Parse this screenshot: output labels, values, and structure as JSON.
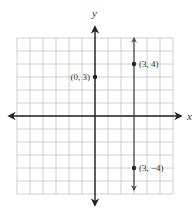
{
  "chart_data": {
    "type": "scatter",
    "title": "",
    "xlabel": "x",
    "ylabel": "y",
    "xlim": [
      -6,
      6
    ],
    "ylim": [
      -6,
      6
    ],
    "grid": true,
    "grid_step": 1,
    "legend": null,
    "points": [
      {
        "x": 0,
        "y": 3,
        "label": "(0, 3)",
        "label_side": "left"
      },
      {
        "x": 3,
        "y": 4,
        "label": "(3, 4)",
        "label_side": "right"
      },
      {
        "x": 3,
        "y": -4,
        "label": "(3, −4)",
        "label_side": "right"
      }
    ],
    "lines": [
      {
        "type": "vertical",
        "x": 3,
        "arrows": "both",
        "extent": [
          -5.7,
          6
        ]
      }
    ]
  },
  "colors": {
    "grid": "#c4c4c4",
    "axis": "#222222",
    "line": "#444444",
    "point": "#222222",
    "text": "#333333"
  }
}
